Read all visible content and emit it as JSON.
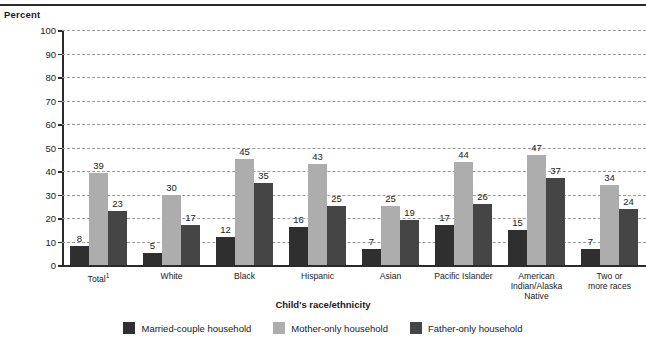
{
  "chart_data": {
    "type": "bar",
    "title": "",
    "ylabel": "Percent",
    "xlabel": "Child's race/ethnicity",
    "ylim": [
      0,
      100
    ],
    "yticks": [
      0,
      10,
      20,
      30,
      40,
      50,
      60,
      70,
      80,
      90,
      100
    ],
    "grid": true,
    "legend_position": "bottom",
    "categories": [
      "Total",
      "White",
      "Black",
      "Hispanic",
      "Asian",
      "Pacific Islander",
      "American Indian/Alaska Native",
      "Two or more races"
    ],
    "category_lines": [
      [
        "Total"
      ],
      [
        "White"
      ],
      [
        "Black"
      ],
      [
        "Hispanic"
      ],
      [
        "Asian"
      ],
      [
        "Pacific Islander"
      ],
      [
        "American",
        "Indian/Alaska",
        "Native"
      ],
      [
        "Two or",
        "more races"
      ]
    ],
    "category_footnote_marks": [
      "1",
      "",
      "",
      "",
      "",
      "",
      "",
      ""
    ],
    "series": [
      {
        "name": "Married-couple household",
        "color": "#2f2f2f",
        "values": [
          8,
          5,
          12,
          16,
          7,
          17,
          15,
          7
        ]
      },
      {
        "name": "Mother-only household",
        "color": "#adadad",
        "values": [
          39,
          30,
          45,
          43,
          25,
          44,
          47,
          34
        ]
      },
      {
        "name": "Father-only household",
        "color": "#454545",
        "values": [
          23,
          17,
          35,
          25,
          19,
          26,
          37,
          24
        ]
      }
    ]
  },
  "legend": {
    "items": [
      {
        "label": "Married-couple household",
        "swatch": "s0"
      },
      {
        "label": "Mother-only household",
        "swatch": "s1"
      },
      {
        "label": "Father-only household",
        "swatch": "s2"
      }
    ]
  }
}
